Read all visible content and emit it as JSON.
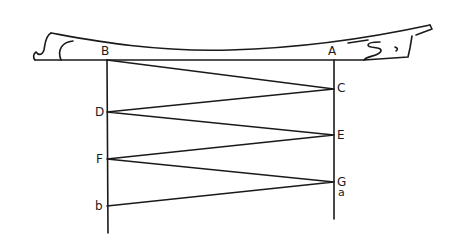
{
  "diagram": {
    "colors": {
      "ink": "#1a1a1a",
      "background": "#ffffff"
    },
    "labels": {
      "B": "B",
      "A": "A",
      "C": "C",
      "D": "D",
      "E": "E",
      "F": "F",
      "G": "G",
      "a": "a",
      "b": "b"
    }
  }
}
